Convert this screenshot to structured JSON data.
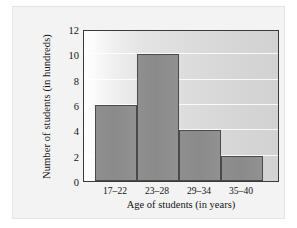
{
  "chart_data": {
    "type": "bar",
    "title": "",
    "xlabel": "Age of students (in years)",
    "ylabel": "Number of students (in hundreds)",
    "categories": [
      "17–22",
      "23–28",
      "29–34",
      "35–40"
    ],
    "values": [
      6,
      10,
      4,
      2
    ],
    "ylim": [
      0,
      12
    ],
    "yticks": [
      0,
      2,
      4,
      6,
      8,
      10,
      12
    ],
    "ytick_labels": [
      "0",
      "2",
      "4",
      "6",
      "8",
      "10",
      "12"
    ],
    "grid": "horizontal",
    "legend": "none",
    "bar_color": "#8e8e8e",
    "bar_edge_color": "#4a4a4a",
    "axis_color": "#3a3a3a",
    "plot_background": "#dcdcdc",
    "figure_background": "#f3f3f3"
  }
}
